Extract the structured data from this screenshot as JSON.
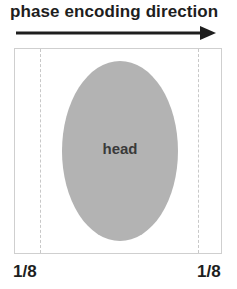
{
  "diagram": {
    "title": "phase encoding direction",
    "arrow": {
      "direction": "right",
      "color": "#1e1e1e"
    },
    "field_of_view": {
      "border_color": "#cfcfcf",
      "dashed_lines": [
        "left",
        "right"
      ]
    },
    "object": {
      "shape": "ellipse",
      "label": "head",
      "fill": "#b3b3b3"
    },
    "fractions": {
      "left": "1/8",
      "right": "1/8"
    }
  }
}
